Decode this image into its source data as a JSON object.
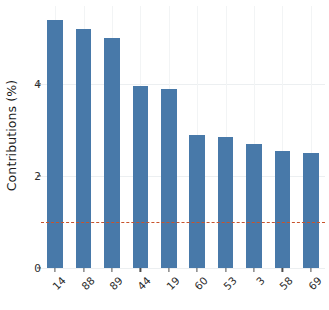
{
  "chart_data": {
    "type": "bar",
    "title": "",
    "subtitle": "",
    "xlabel": "",
    "ylabel": "Contributions (%)",
    "categories": [
      "14",
      "88",
      "89",
      "44",
      "19",
      "60",
      "53",
      "3",
      "58",
      "69"
    ],
    "values": [
      5.4,
      5.2,
      5.0,
      3.96,
      3.9,
      2.9,
      2.85,
      2.7,
      2.55,
      2.5
    ],
    "series": [
      {
        "name": "Contributions",
        "values": [
          5.4,
          5.2,
          5.0,
          3.96,
          3.9,
          2.9,
          2.85,
          2.7,
          2.55,
          2.5
        ]
      }
    ],
    "ylim": [
      0,
      5.7
    ],
    "xlim": [
      0,
      10
    ],
    "y_ticks": [
      0,
      2,
      4
    ],
    "y_tick_labels": [
      "0",
      "2",
      "4"
    ],
    "grid": true,
    "grid_axis": "both",
    "legend": false,
    "legend_position": "none",
    "bar_color": "#4879a9",
    "background_color": "#ffffff",
    "grid_color": "#eceff1",
    "x_tick_label_rotation": -45,
    "annotations": [
      {
        "type": "hline",
        "name": "expected-contribution-reference-line",
        "value": 1.0,
        "style": "dashed",
        "color": "#c8542a",
        "label": ""
      }
    ]
  }
}
